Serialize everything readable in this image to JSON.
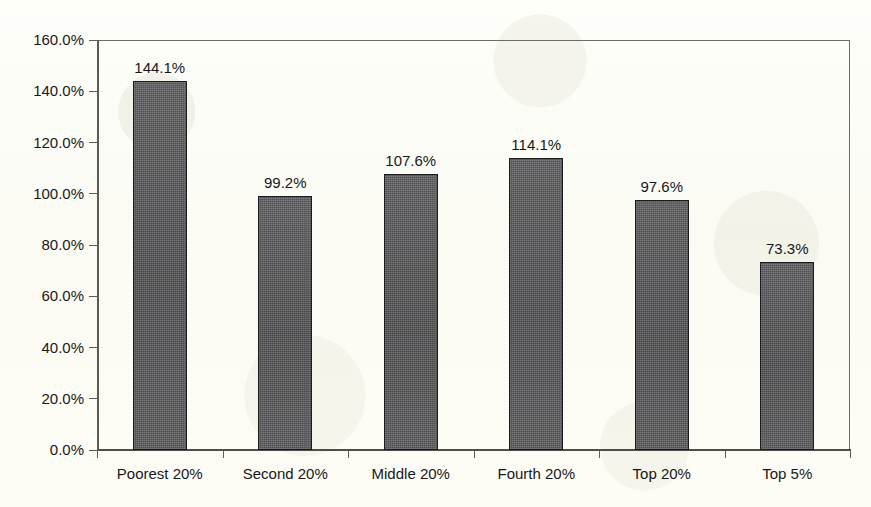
{
  "chart_data": {
    "type": "bar",
    "title": "",
    "subtitle": "",
    "xlabel": "",
    "ylabel": "",
    "categories": [
      "Poorest 20%",
      "Second 20%",
      "Middle 20%",
      "Fourth 20%",
      "Top 20%",
      "Top 5%"
    ],
    "values": [
      144.1,
      99.2,
      107.6,
      114.1,
      97.6,
      73.3
    ],
    "value_labels": [
      "144.1%",
      "99.2%",
      "107.6%",
      "114.1%",
      "97.6%",
      "73.3%"
    ],
    "ylim": [
      0,
      160
    ],
    "ytick_step": 20,
    "ytick_labels": [
      "160.0%",
      "140.0%",
      "120.0%",
      "100.0%",
      "80.0%",
      "60.0%",
      "40.0%",
      "20.0%",
      "0.0%"
    ],
    "ytick_values": [
      160,
      140,
      120,
      100,
      80,
      60,
      40,
      20,
      0
    ],
    "grid": false,
    "legend": false,
    "legend_position": "none",
    "bar_color": "#58585a",
    "bar_border_color": "#1b1b1d",
    "axis_color": "#5a5a56",
    "text_color": "#17171a",
    "background_color": "#fdfdf7",
    "data_labels_shown": true
  },
  "axis": {
    "y_labels": [
      "160.0%",
      "140.0%",
      "120.0%",
      "100.0%",
      "80.0%",
      "60.0%",
      "40.0%",
      "20.0%",
      "0.0%"
    ],
    "x_labels": [
      "Poorest 20%",
      "Second 20%",
      "Middle 20%",
      "Fourth 20%",
      "Top 20%",
      "Top 5%"
    ]
  },
  "bars": [
    {
      "category": "Poorest 20%",
      "value": 144.1,
      "label": "144.1%"
    },
    {
      "category": "Second 20%",
      "value": 99.2,
      "label": "99.2%"
    },
    {
      "category": "Middle 20%",
      "value": 107.6,
      "label": "107.6%"
    },
    {
      "category": "Fourth 20%",
      "value": 114.1,
      "label": "114.1%"
    },
    {
      "category": "Top 20%",
      "value": 97.6,
      "label": "97.6%"
    },
    {
      "category": "Top 5%",
      "value": 73.3,
      "label": "73.3%"
    }
  ]
}
